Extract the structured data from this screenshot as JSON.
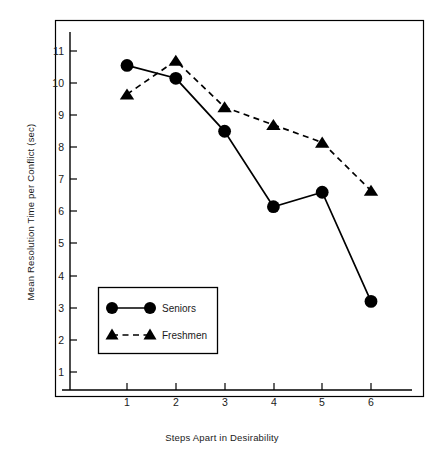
{
  "chart_data": {
    "type": "line",
    "title": "",
    "xlabel": "Steps Apart in Desirability",
    "ylabel": "Mean Resolution Time per Conflict (sec)",
    "x": [
      1,
      2,
      3,
      4,
      5,
      6
    ],
    "xticklabels": [
      "1",
      "2",
      "3",
      "4",
      "5",
      "6"
    ],
    "yticklabels": [
      "1",
      "2",
      "3",
      "4",
      "5",
      "6",
      "7",
      "8",
      "9",
      "10",
      "11"
    ],
    "yticks": [
      1,
      2,
      3,
      4,
      5,
      6,
      7,
      8,
      9,
      10,
      11
    ],
    "xlim": [
      0.4,
      6.6
    ],
    "ylim": [
      0.2,
      11.6
    ],
    "grid": false,
    "legend_position": "lower left",
    "series": [
      {
        "name": "Seniors",
        "values": [
          10.55,
          10.15,
          8.5,
          6.15,
          6.6,
          3.2
        ],
        "marker": "circle",
        "linestyle": "solid",
        "color": "#000000"
      },
      {
        "name": "Freshmen",
        "values": [
          9.65,
          10.7,
          9.25,
          8.7,
          8.15,
          6.65
        ],
        "marker": "triangle",
        "linestyle": "dashed",
        "color": "#000000"
      }
    ]
  },
  "figure": {
    "background_color": "#ffffff",
    "border_color": "#000000",
    "frame_label": "plot-frame"
  },
  "legend": {
    "entries": [
      {
        "label": "Seniors",
        "marker": "circle",
        "linestyle": "solid"
      },
      {
        "label": "Freshmen",
        "marker": "triangle",
        "linestyle": "dashed"
      }
    ]
  }
}
